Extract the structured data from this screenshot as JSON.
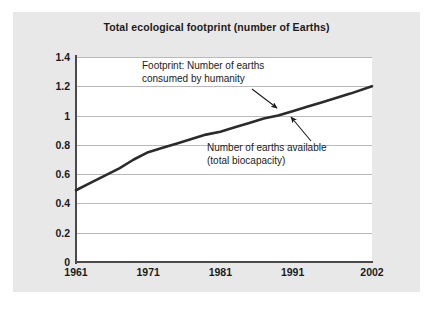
{
  "figure": {
    "panel_background": "#e8e8e8",
    "plot_background": "#ffffff",
    "line_color": "#2b2b2b",
    "grid_color": "#b9b9b9",
    "axis_color": "#4a4a4a",
    "text_color": "#1b1b1b"
  },
  "annotations": {
    "footprint_line1": "Footprint: Number of earths",
    "footprint_line2": "consumed by humanity",
    "biocapacity_line1": "Number of earths available",
    "biocapacity_line2": "(total biocapacity)"
  },
  "chart_data": {
    "type": "line",
    "title": "Total ecological footprint (number of Earths)",
    "xlabel": "",
    "ylabel": "",
    "xlim": [
      1961,
      2002
    ],
    "ylim": [
      0,
      1.4
    ],
    "grid": true,
    "legend_position": "none",
    "xticks": [
      "1961",
      "1971",
      "1981",
      "1991",
      "2002"
    ],
    "xtick_values": [
      1961,
      1971,
      1981,
      1991,
      2002
    ],
    "yticks": [
      "0",
      "0.2",
      "0.4",
      "0.6",
      "0.8",
      "1",
      "1.2",
      "1.4"
    ],
    "ytick_values": [
      0,
      0.2,
      0.4,
      0.6,
      0.8,
      1,
      1.2,
      1.4
    ],
    "series": [
      {
        "name": "Total ecological footprint (number of Earths)",
        "x": [
          1961,
          1963,
          1965,
          1967,
          1969,
          1971,
          1973,
          1975,
          1977,
          1979,
          1981,
          1983,
          1985,
          1987,
          1989,
          1991,
          1993,
          1995,
          1997,
          1999,
          2002
        ],
        "values": [
          0.49,
          0.54,
          0.59,
          0.64,
          0.7,
          0.75,
          0.78,
          0.81,
          0.84,
          0.87,
          0.89,
          0.92,
          0.95,
          0.98,
          1.0,
          1.03,
          1.06,
          1.09,
          1.12,
          1.15,
          1.2
        ]
      }
    ],
    "annotations": [
      {
        "text": "Footprint: Number of earths consumed by humanity",
        "points_to_x": 1990.5,
        "points_to_y": 1.09
      },
      {
        "text": "Number of earths available (total biocapacity)",
        "points_to_x": 1992.5,
        "points_to_y": 1.04
      }
    ]
  }
}
